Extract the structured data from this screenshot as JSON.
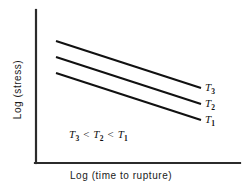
{
  "chart_data": {
    "type": "line",
    "title": "",
    "xlabel": "Log (time to rupture)",
    "ylabel": "Log (stress)",
    "grid": false,
    "legend_position": "right-of-line-ends",
    "axes": {
      "x_ticks": [],
      "y_ticks": [],
      "x_range_note": "unlabeled schematic axis",
      "y_range_note": "unlabeled schematic axis"
    },
    "annotations": [
      {
        "name": "temperature-ordering",
        "text": "T3 < T2 < T1",
        "parts": [
          "T",
          "3",
          " < ",
          "T",
          "2",
          " < ",
          "T",
          "1"
        ]
      }
    ],
    "series": [
      {
        "name": "T3",
        "label": "T",
        "subscript": "3",
        "start": [
          56,
          41
        ],
        "end": [
          201,
          88
        ],
        "note": "topmost line, lowest temperature"
      },
      {
        "name": "T2",
        "label": "T",
        "subscript": "2",
        "start": [
          56,
          57
        ],
        "end": [
          201,
          104
        ],
        "note": "middle line"
      },
      {
        "name": "T1",
        "label": "T",
        "subscript": "1",
        "start": [
          56,
          73
        ],
        "end": [
          201,
          120
        ],
        "note": "bottom line, highest temperature"
      }
    ]
  },
  "axes_geometry": {
    "y_axis": {
      "x": 36,
      "y_top": 10,
      "y_bottom": 163
    },
    "x_axis": {
      "y": 163,
      "x_left": 36,
      "x_right": 240
    }
  },
  "colors": {
    "background": "#ffffff",
    "axis": "#2b2b2b",
    "data_line": "#111111",
    "text": "#1a1a1a"
  },
  "labels": {
    "x_axis": "Log (time to rupture)",
    "y_axis": "Log (stress)",
    "series_base": "T",
    "subscript_3": "3",
    "subscript_2": "2",
    "subscript_1": "1",
    "less_than": " < "
  }
}
